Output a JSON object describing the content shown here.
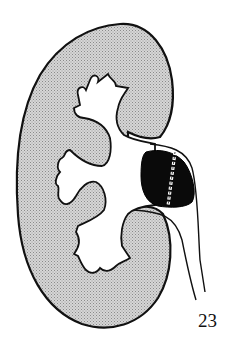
{
  "figure": {
    "number": "23",
    "colors": {
      "background": "#ffffff",
      "parenchyma_fill": "#c8c8c8",
      "outline": "#111111",
      "mass_fill": "#0a0a0a",
      "pelvis_fill": "#ffffff"
    },
    "elements": [
      {
        "name": "kidney-outline",
        "label": "Kidney (renal parenchyma, stippled)"
      },
      {
        "name": "renal-pelvis",
        "label": "Renal pelvis and calyces (white)"
      },
      {
        "name": "mass",
        "label": "Dark mass at pelvis/ureteropelvic junction"
      },
      {
        "name": "incision-line",
        "label": "Dashed/sutured incision line across mass"
      },
      {
        "name": "ureter",
        "label": "Ureter descending from hilum"
      }
    ]
  }
}
